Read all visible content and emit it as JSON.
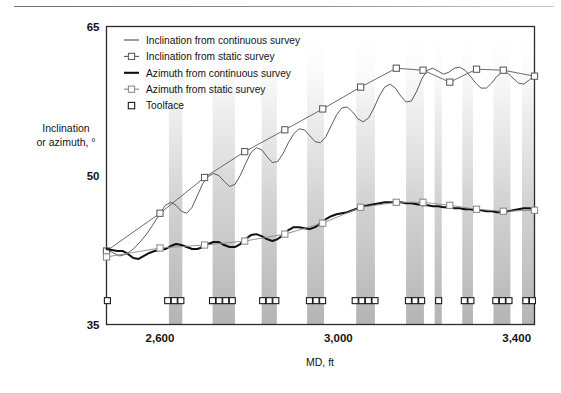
{
  "figure": {
    "background": "#ffffff",
    "frame_color": "#2b2b2b",
    "has_top_rule": true
  },
  "chart_data": {
    "type": "line",
    "title": "",
    "xlabel": "MD, ft",
    "ylabel": "Inclination or azimuth, °",
    "xlim": [
      2480,
      3440
    ],
    "ylim": [
      35,
      65
    ],
    "xticks": [
      2600,
      3000,
      3400
    ],
    "xtick_labels": [
      "2,600",
      "3,000",
      "3,400"
    ],
    "yticks": [
      35,
      50,
      65
    ],
    "ytick_labels": [
      "35",
      "50",
      "65"
    ],
    "grid": false,
    "legend_position": "top-left",
    "series": [
      {
        "name": "Inclination from continuous survey",
        "marker": "none",
        "color": "#4a4a4a",
        "width": 0.9,
        "x": [
          2480,
          2495,
          2510,
          2525,
          2540,
          2555,
          2570,
          2585,
          2600,
          2612,
          2624,
          2636,
          2648,
          2660,
          2672,
          2684,
          2696,
          2708,
          2720,
          2732,
          2744,
          2756,
          2768,
          2780,
          2792,
          2804,
          2816,
          2828,
          2840,
          2852,
          2864,
          2876,
          2888,
          2900,
          2912,
          2924,
          2936,
          2948,
          2960,
          2972,
          2984,
          2996,
          3008,
          3020,
          3032,
          3044,
          3056,
          3068,
          3080,
          3092,
          3104,
          3116,
          3128,
          3140,
          3152,
          3164,
          3176,
          3188,
          3200,
          3212,
          3224,
          3236,
          3248,
          3260,
          3272,
          3284,
          3296,
          3308,
          3320,
          3332,
          3344,
          3356,
          3368,
          3380,
          3392,
          3404,
          3416,
          3428,
          3440
        ],
        "y": [
          42.6,
          42.2,
          41.9,
          42.1,
          42.6,
          43.3,
          44.1,
          45.1,
          46.2,
          47.0,
          47.3,
          47.0,
          46.4,
          46.2,
          46.8,
          48.0,
          49.2,
          49.9,
          50.2,
          50.0,
          49.4,
          48.9,
          49.1,
          50.0,
          51.2,
          52.3,
          52.8,
          52.6,
          51.9,
          51.3,
          51.4,
          52.2,
          53.3,
          54.2,
          54.7,
          54.6,
          54.0,
          53.4,
          53.3,
          53.9,
          55.0,
          56.1,
          56.8,
          56.9,
          56.4,
          55.7,
          55.4,
          55.8,
          56.8,
          58.0,
          58.9,
          59.2,
          58.8,
          58.0,
          57.4,
          57.5,
          58.5,
          59.8,
          60.6,
          60.8,
          60.5,
          60.2,
          60.4,
          60.8,
          60.9,
          60.6,
          60.0,
          59.3,
          58.8,
          58.8,
          59.3,
          60.0,
          60.4,
          60.3,
          59.8,
          59.3,
          59.2,
          59.6,
          60.1
        ]
      },
      {
        "name": "Inclination from static survey",
        "marker": "square",
        "color": "#5a5a5a",
        "width": 0.9,
        "x": [
          2480,
          2600,
          2700,
          2790,
          2880,
          2965,
          3050,
          3130,
          3190,
          3250,
          3310,
          3370,
          3440
        ],
        "y": [
          42.4,
          46.2,
          49.8,
          52.4,
          54.6,
          56.7,
          58.9,
          60.8,
          60.6,
          59.4,
          60.7,
          60.6,
          60.0
        ]
      },
      {
        "name": "Azimuth from continuous survey",
        "marker": "none",
        "color": "#101010",
        "width": 2.0,
        "x": [
          2480,
          2492,
          2504,
          2516,
          2528,
          2540,
          2552,
          2564,
          2576,
          2588,
          2600,
          2612,
          2624,
          2636,
          2648,
          2660,
          2672,
          2684,
          2696,
          2708,
          2720,
          2732,
          2744,
          2756,
          2768,
          2780,
          2792,
          2804,
          2816,
          2828,
          2840,
          2852,
          2864,
          2876,
          2888,
          2900,
          2912,
          2924,
          2936,
          2948,
          2960,
          2972,
          2984,
          2996,
          3008,
          3020,
          3032,
          3044,
          3056,
          3068,
          3080,
          3092,
          3104,
          3116,
          3128,
          3140,
          3152,
          3164,
          3176,
          3188,
          3200,
          3212,
          3224,
          3236,
          3248,
          3260,
          3272,
          3284,
          3296,
          3308,
          3320,
          3332,
          3344,
          3356,
          3368,
          3380,
          3392,
          3404,
          3416,
          3428,
          3440
        ],
        "y": [
          42.6,
          42.5,
          42.4,
          42.4,
          42.1,
          41.7,
          41.6,
          41.9,
          42.2,
          42.4,
          42.5,
          42.6,
          42.9,
          43.1,
          43.0,
          42.8,
          42.6,
          42.6,
          42.8,
          43.1,
          43.3,
          43.3,
          43.0,
          42.8,
          42.8,
          43.1,
          43.6,
          44.0,
          44.1,
          43.9,
          43.6,
          43.4,
          43.6,
          44.0,
          44.5,
          44.8,
          44.8,
          44.7,
          44.6,
          44.8,
          45.2,
          45.6,
          45.9,
          46.1,
          46.2,
          46.3,
          46.5,
          46.7,
          46.9,
          47.0,
          47.1,
          47.2,
          47.3,
          47.3,
          47.3,
          47.3,
          47.2,
          47.2,
          47.1,
          47.0,
          47.0,
          46.9,
          46.9,
          46.8,
          46.8,
          46.7,
          46.7,
          46.6,
          46.6,
          46.5,
          46.5,
          46.4,
          46.4,
          46.3,
          46.3,
          46.4,
          46.5,
          46.6,
          46.7,
          46.7,
          46.6
        ]
      },
      {
        "name": "Azimuth from static survey",
        "marker": "square",
        "color": "#8a8a8a",
        "width": 0.9,
        "x": [
          2480,
          2600,
          2700,
          2790,
          2880,
          2965,
          3050,
          3130,
          3190,
          3250,
          3310,
          3370,
          3440
        ],
        "y": [
          41.8,
          42.7,
          43.0,
          43.4,
          44.1,
          45.2,
          46.8,
          47.3,
          47.3,
          47.0,
          46.6,
          46.4,
          46.5
        ]
      }
    ],
    "toolface": {
      "name": "Toolface",
      "marker": "square",
      "color": "#1a1a1a",
      "y": 37.4,
      "groups": [
        {
          "x_center": 2482,
          "count": 1
        },
        {
          "x_center": 2632,
          "count": 3
        },
        {
          "x_center": 2740,
          "count": 4
        },
        {
          "x_center": 2845,
          "count": 3
        },
        {
          "x_center": 2950,
          "count": 3
        },
        {
          "x_center": 3060,
          "count": 4
        },
        {
          "x_center": 3172,
          "count": 3
        },
        {
          "x_center": 3225,
          "count": 1
        },
        {
          "x_center": 3290,
          "count": 2
        },
        {
          "x_center": 3368,
          "count": 3
        },
        {
          "x_center": 3428,
          "count": 2
        }
      ]
    },
    "bands": {
      "color_top": "#ffffff",
      "color_bottom": "#b9b9b9",
      "note": "Vertical shaded intervals fading from white at top to gray at bottom",
      "intervals": [
        [
          2620,
          2650
        ],
        [
          2718,
          2768
        ],
        [
          2828,
          2862
        ],
        [
          2930,
          2968
        ],
        [
          3040,
          3082
        ],
        [
          3152,
          3192
        ],
        [
          3216,
          3232
        ],
        [
          3278,
          3302
        ],
        [
          3348,
          3386
        ],
        [
          3412,
          3440
        ]
      ]
    }
  },
  "legend": {
    "items": [
      {
        "label": "Inclination from continuous survey",
        "symbol": "line",
        "color": "#4a4a4a"
      },
      {
        "label": "Inclination from static survey",
        "symbol": "line-square",
        "color": "#5a5a5a"
      },
      {
        "label": "Azimuth from continuous survey",
        "symbol": "thick-line",
        "color": "#101010"
      },
      {
        "label": "Azimuth from static survey",
        "symbol": "line-square",
        "color": "#8a8a8a"
      },
      {
        "label": "Toolface",
        "symbol": "square",
        "color": "#1a1a1a"
      }
    ]
  }
}
